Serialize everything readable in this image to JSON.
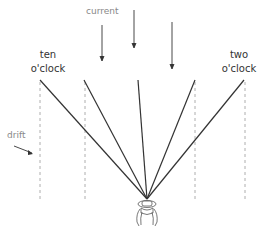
{
  "diagram": {
    "labels": {
      "current": "current",
      "drift": "drift",
      "left_line1": "ten",
      "left_line2": "o'clock",
      "right_line1": "two",
      "right_line2": "o'clock"
    },
    "colors": {
      "line": "#333333",
      "dashed": "#999999",
      "arrow": "#333333",
      "grey_text": "#888888"
    },
    "fan_origin": [
      147,
      199
    ],
    "fan_tops": [
      [
        40,
        80
      ],
      [
        84,
        80
      ],
      [
        138,
        80
      ],
      [
        195,
        80
      ],
      [
        244,
        80
      ]
    ],
    "dashed_x": [
      40,
      85,
      195,
      245
    ],
    "current_arrows": [
      [
        102,
        25,
        60
      ],
      [
        134,
        10,
        47
      ],
      [
        172,
        22,
        68
      ]
    ]
  }
}
